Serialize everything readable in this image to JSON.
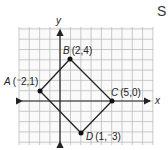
{
  "diagram": {
    "type": "coordinate-plane-quadrilateral",
    "axes": {
      "x_label": "x",
      "y_label": "y"
    },
    "grid": {
      "x_min": -4,
      "x_max": 9,
      "y_min": -4,
      "y_max": 7
    },
    "points": [
      {
        "name": "A",
        "coords": "(⁻2,1)",
        "x": -2,
        "y": 1
      },
      {
        "name": "B",
        "coords": "(2,4)",
        "x": 2,
        "y": 4
      },
      {
        "name": "C",
        "coords": "(5,0)",
        "x": 5,
        "y": 0
      },
      {
        "name": "D",
        "coords": "(1,⁻3)",
        "x": 1,
        "y": -3
      }
    ],
    "edges": [
      [
        "A",
        "B"
      ],
      [
        "B",
        "C"
      ],
      [
        "C",
        "D"
      ],
      [
        "D",
        "A"
      ]
    ],
    "cut_text": "S"
  }
}
